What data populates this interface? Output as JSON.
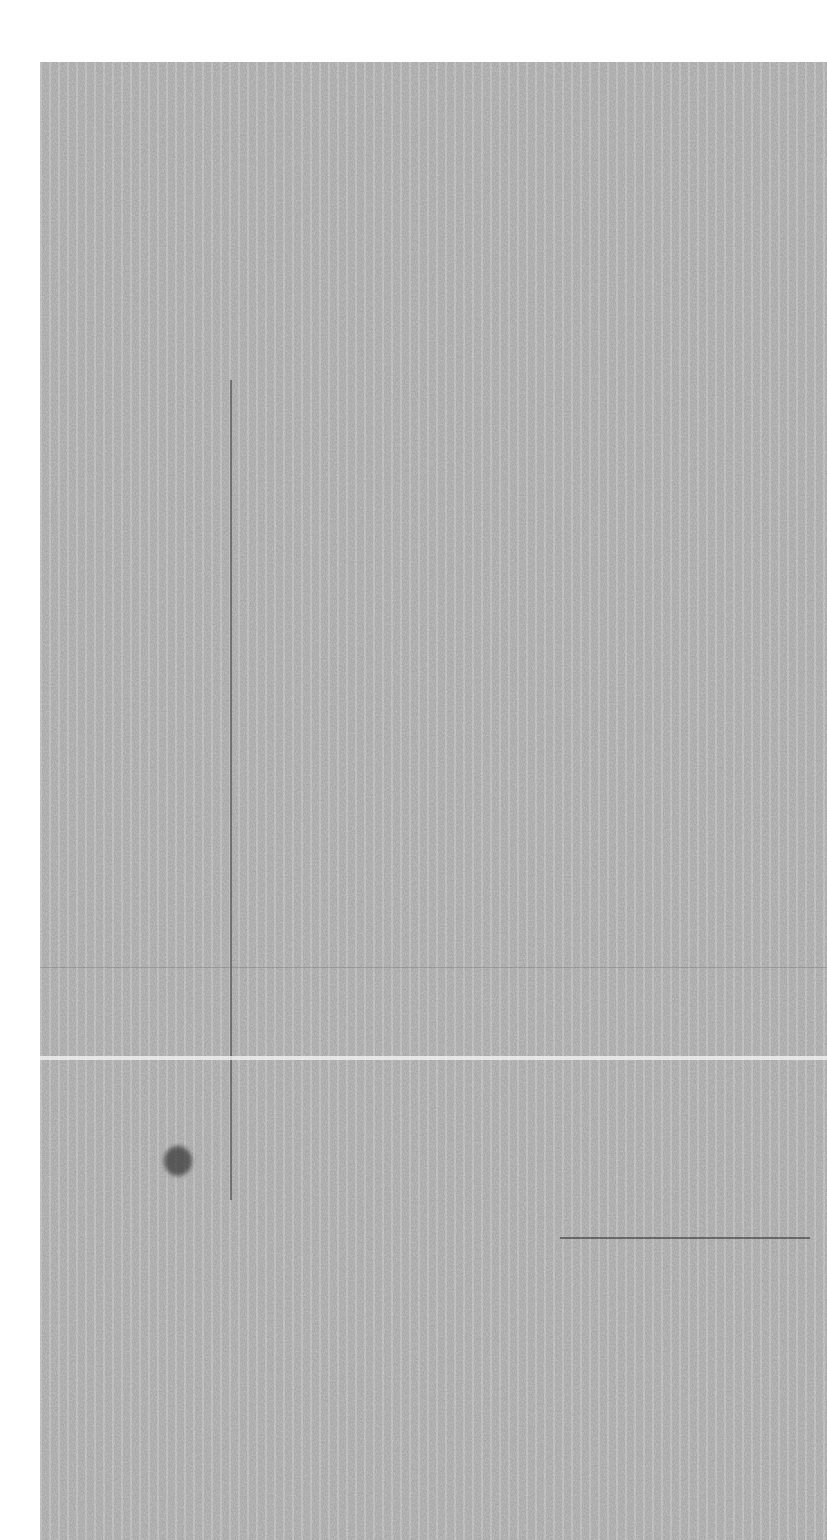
{
  "image": {
    "description": "Grayscale noise texture resembling a scanned/degraded surface",
    "background_color": "#ffffff",
    "noise_region": {
      "x": 40,
      "y": 62,
      "width": 787,
      "height": 1478
    },
    "noise_base_color": "#9a9a9a"
  },
  "features": [
    {
      "type": "vertical-dark-line",
      "x": 230,
      "y1": 380,
      "y2": 1200,
      "color": "#3a3a3a"
    },
    {
      "type": "horizontal-light-band",
      "y": 1058,
      "x1": 40,
      "x2": 827,
      "color": "#f2f2f2"
    },
    {
      "type": "horizontal-dark-line",
      "y": 967,
      "x1": 40,
      "x2": 827,
      "color": "#6a6a6a"
    },
    {
      "type": "horizontal-dark-line-right",
      "y": 1237,
      "x1": 560,
      "x2": 810,
      "color": "#2a2a2a"
    },
    {
      "type": "dark-blob",
      "x": 178,
      "y": 1160,
      "r": 14,
      "color": "#1e1e1e"
    }
  ]
}
